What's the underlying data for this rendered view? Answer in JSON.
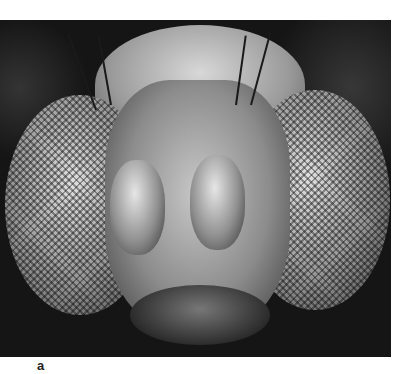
{
  "figure": {
    "panel_label": "a",
    "colors": {
      "background": "#ffffff",
      "image_dark": "#151515",
      "label": "#222222"
    }
  }
}
